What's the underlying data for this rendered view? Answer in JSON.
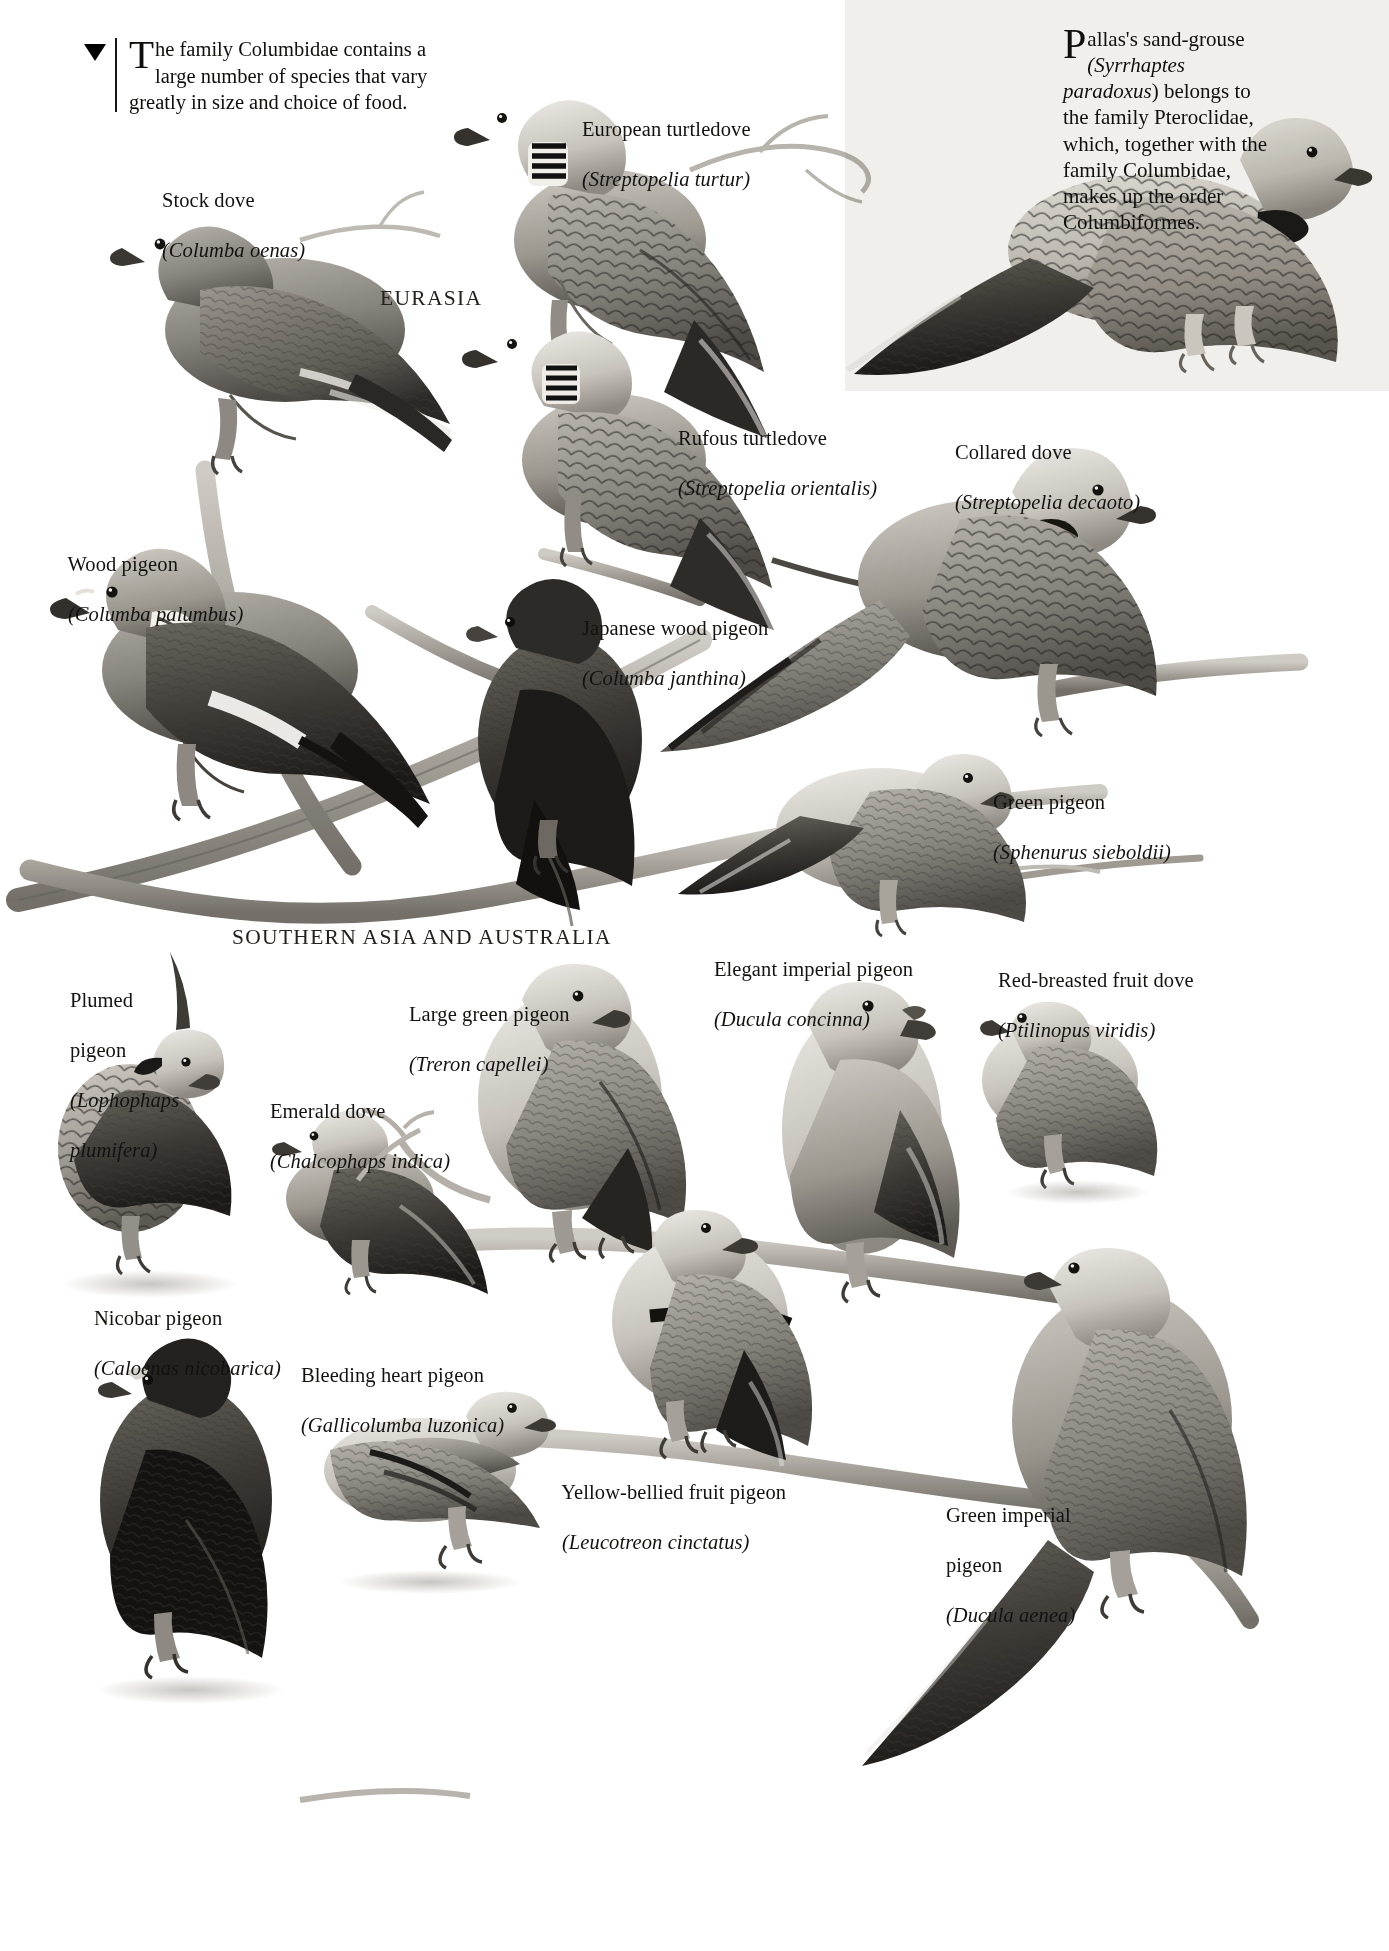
{
  "page": {
    "width": 1389,
    "height": 1951,
    "background": "#ffffff",
    "ink": "#141210"
  },
  "intro": {
    "dropcap": "T",
    "text": "he family Columbidae contains a large number of species that vary greatly in size and choice of food.",
    "marker_icon": "down-triangle-icon"
  },
  "sandgrouse_note": {
    "dropcap": "P",
    "line1": "allas's sand-grouse",
    "genus": "(Syrrhaptes",
    "species": "paradoxus",
    "rest": ") belongs to the family Pteroclidae, which, together with the family Columbidae, makes up the order Columbiformes.",
    "panel_color": "#f0efec"
  },
  "regions": [
    {
      "id": "eurasia",
      "label": "EURASIA",
      "x": 380,
      "y": 286
    },
    {
      "id": "southern-asia-australia",
      "label": "SOUTHERN ASIA AND AUSTRALIA",
      "x": 232,
      "y": 925
    }
  ],
  "species": [
    {
      "id": "stock-dove",
      "common": "Stock dove",
      "scientific": "(Columba oenas)",
      "x": 141,
      "y": 163
    },
    {
      "id": "european-turtledove",
      "common": "European turtledove",
      "scientific": "(Streptopelia turtur)",
      "x": 561,
      "y": 92
    },
    {
      "id": "rufous-turtledove",
      "common": "Rufous turtledove",
      "scientific": "(Streptopelia orientalis)",
      "x": 657,
      "y": 401
    },
    {
      "id": "collared-dove",
      "common": "Collared dove",
      "scientific": "(Streptopelia decaoto)",
      "x": 934,
      "y": 415
    },
    {
      "id": "wood-pigeon",
      "common": "Wood pigeon",
      "scientific": "(Columba palumbus)",
      "x": 47,
      "y": 527
    },
    {
      "id": "japanese-wood-pigeon",
      "common": "Japanese wood pigeon",
      "scientific": "(Columba janthina)",
      "x": 561,
      "y": 591
    },
    {
      "id": "green-pigeon",
      "common": "Green pigeon",
      "scientific": "(Sphenurus sieboldii)",
      "x": 972,
      "y": 765
    },
    {
      "id": "plumed-pigeon",
      "common_line1": "Plumed",
      "common_line2": "pigeon",
      "scientific_line1": "(Lophophaps",
      "scientific_line2": "plumifera)",
      "x": 49,
      "y": 963
    },
    {
      "id": "large-green-pigeon",
      "common": "Large green pigeon",
      "scientific": "(Treron capellei)",
      "x": 388,
      "y": 977
    },
    {
      "id": "elegant-imperial-pigeon",
      "common": "Elegant imperial pigeon",
      "scientific": "(Ducula concinna)",
      "x": 693,
      "y": 932
    },
    {
      "id": "red-breasted-fruit-dove",
      "common": "Red-breasted fruit dove",
      "scientific": "(Ptilinopus viridis)",
      "x": 977,
      "y": 943
    },
    {
      "id": "emerald-dove",
      "common": "Emerald dove",
      "scientific": "(Chalcophaps indica)",
      "x": 249,
      "y": 1074
    },
    {
      "id": "nicobar-pigeon",
      "common": "Nicobar pigeon",
      "scientific": "(Caloenas nicobarica)",
      "x": 73,
      "y": 1281
    },
    {
      "id": "bleeding-heart-pigeon",
      "common": "Bleeding heart pigeon",
      "scientific": "(Gallicolumba luzonica)",
      "x": 280,
      "y": 1338
    },
    {
      "id": "yellow-bellied-fruit-pigeon",
      "common": "Yellow-bellied fruit pigeon",
      "scientific": "(Leucotreon cinctatus)",
      "x": 541,
      "y": 1455
    },
    {
      "id": "green-imperial-pigeon",
      "common_line1": "Green imperial",
      "common_line2": "pigeon",
      "scientific": "(Ducula aenea)",
      "x": 925,
      "y": 1478
    }
  ]
}
